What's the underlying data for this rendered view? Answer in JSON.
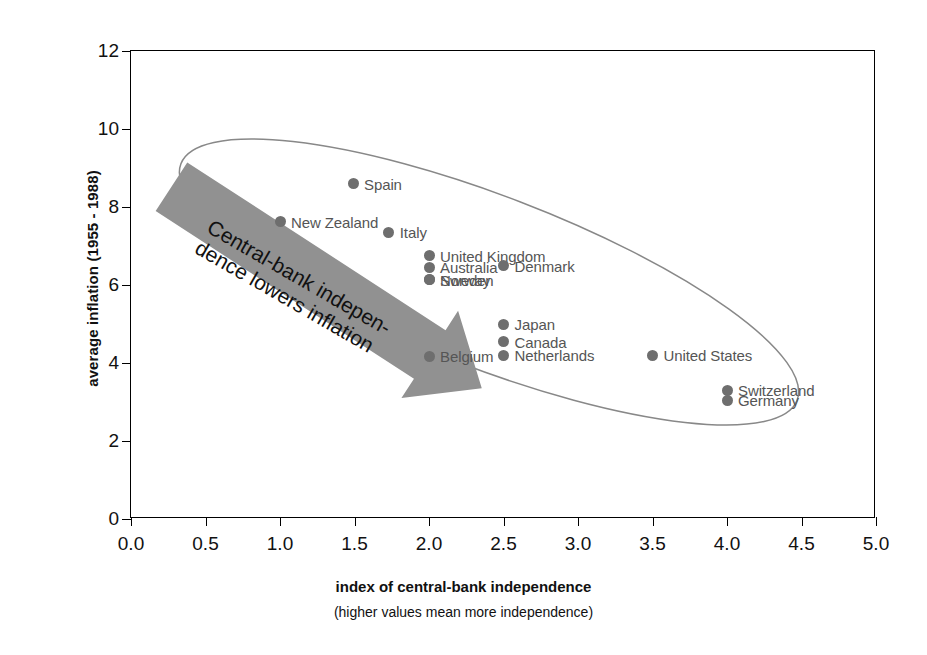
{
  "chart_data": {
    "type": "scatter",
    "title": "",
    "xlabel": "index of central-bank independence",
    "xlabel_sub": "(higher values mean more independence)",
    "ylabel": "average inflation (1955 - 1988)",
    "xlim": [
      0,
      5
    ],
    "ylim": [
      0,
      12
    ],
    "xticks": [
      "0.0",
      "0.5",
      "1.0",
      "1.5",
      "2.0",
      "2.5",
      "3.0",
      "3.5",
      "4.0",
      "4.5",
      "5.0"
    ],
    "xtick_values": [
      0,
      0.5,
      1.0,
      1.5,
      2.0,
      2.5,
      3.0,
      3.5,
      4.0,
      4.5,
      5.0
    ],
    "yticks": [
      "0",
      "2",
      "4",
      "6",
      "8",
      "10",
      "12"
    ],
    "ytick_values": [
      0,
      2,
      4,
      6,
      8,
      10,
      12
    ],
    "grid": false,
    "legend": "none",
    "marker_color": "#6e6e6e",
    "points": [
      {
        "label": "Spain",
        "x": 1.49,
        "y": 8.6,
        "label_side": "right"
      },
      {
        "label": "New Zealand",
        "x": 1.0,
        "y": 7.62,
        "label_side": "right"
      },
      {
        "label": "Italy",
        "x": 1.73,
        "y": 7.35,
        "label_side": "right"
      },
      {
        "label": "United Kingdom",
        "x": 2.0,
        "y": 6.75,
        "label_side": "right"
      },
      {
        "label": "Australia",
        "x": 2.0,
        "y": 6.45,
        "label_side": "right"
      },
      {
        "label": "Denmark",
        "x": 2.5,
        "y": 6.5,
        "label_side": "right"
      },
      {
        "label": "Sweden",
        "x": 2.0,
        "y": 6.13,
        "label_side": "right"
      },
      {
        "label": "Norway",
        "x": 2.0,
        "y": 6.13,
        "label_side": "right"
      },
      {
        "label": "Japan",
        "x": 2.5,
        "y": 5.0,
        "label_side": "right"
      },
      {
        "label": "Canada",
        "x": 2.5,
        "y": 4.55,
        "label_side": "right"
      },
      {
        "label": "Netherlands",
        "x": 2.5,
        "y": 4.2,
        "label_side": "right"
      },
      {
        "label": "Belgium",
        "x": 2.0,
        "y": 4.17,
        "label_side": "right"
      },
      {
        "label": "United States",
        "x": 3.5,
        "y": 4.2,
        "label_side": "right"
      },
      {
        "label": "Switzerland",
        "x": 4.0,
        "y": 3.3,
        "label_side": "right"
      },
      {
        "label": "Germany",
        "x": 4.0,
        "y": 3.05,
        "label_side": "right"
      }
    ],
    "annotations": [
      {
        "name": "trend-annotation",
        "line1": "Central-bank indepen-",
        "line2": "dence lowers inflation",
        "rotation_deg": 30
      }
    ],
    "shapes": [
      {
        "name": "grouping-ellipse",
        "type": "ellipse",
        "stroke": "#777777"
      },
      {
        "name": "trend-arrow",
        "type": "arrow",
        "fill": "#8f8f8f",
        "direction": "down-right"
      }
    ]
  }
}
